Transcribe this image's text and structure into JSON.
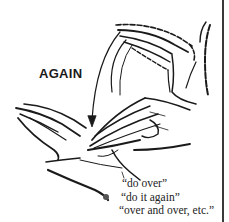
{
  "sign": {
    "title": "AGAIN",
    "meanings": [
      "“do over”",
      "“do it again”",
      "“over and over, etc.”"
    ],
    "bullet_icon": "bullet-dot",
    "illustration": "two-hands-again-sign"
  },
  "colors": {
    "ink": "#1a1a1a",
    "bullet": "#555555",
    "rule": "#3a3a3a"
  }
}
